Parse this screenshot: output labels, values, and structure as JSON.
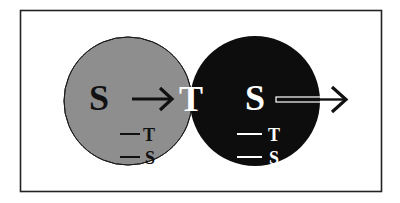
{
  "diagram": {
    "type": "venn",
    "frame": {
      "x": 20,
      "y": 10,
      "width": 362,
      "height": 182,
      "stroke": "#222222"
    },
    "colors": {
      "left_circle": "#8e8e8e",
      "right_circle": "#0d0d0d",
      "intersection": "#4f4f4f",
      "dark_text": "#111111",
      "light_text": "#ffffff"
    },
    "left_circle": {
      "cx": 128,
      "cy": 101,
      "r": 64,
      "main_label": "S",
      "sub_items": [
        {
          "dash": "—",
          "label": "T"
        },
        {
          "dash": "—",
          "label": "S"
        }
      ]
    },
    "intersection": {
      "label": "T"
    },
    "right_circle": {
      "cx": 255,
      "cy": 101,
      "r": 65,
      "main_label": "S",
      "sub_items": [
        {
          "dash": "—",
          "label": "T"
        },
        {
          "dash": "—",
          "label": "S"
        }
      ]
    },
    "arrows": [
      {
        "from": "left S",
        "to": "intersection T",
        "style": "solid-black"
      },
      {
        "from": "right S",
        "to": "outside right",
        "style": "hollow-white-outline"
      }
    ]
  }
}
